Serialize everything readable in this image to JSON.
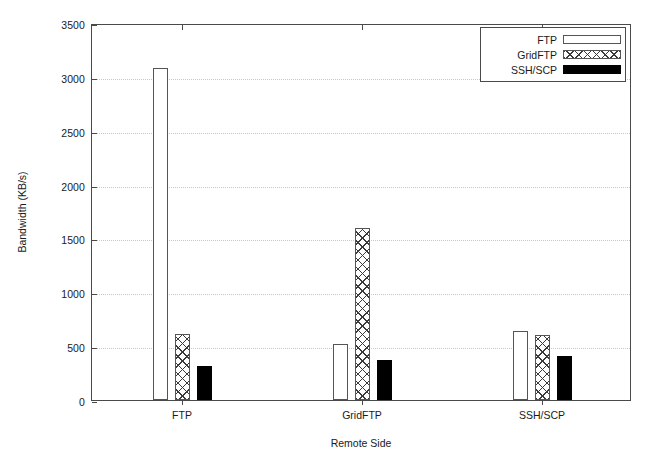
{
  "chart_data": {
    "type": "bar",
    "title": "",
    "subtitle": "",
    "xlabel": "Remote Side",
    "ylabel": "Bandwidth (KB/s)",
    "categories": [
      "FTP",
      "GridFTP",
      "SSH/SCP"
    ],
    "series": [
      {
        "name": "FTP",
        "fill": "open",
        "values": [
          3085,
          520,
          645
        ]
      },
      {
        "name": "GridFTP",
        "fill": "hatch",
        "values": [
          610,
          1595,
          605
        ]
      },
      {
        "name": "SSH/SCP",
        "fill": "solid",
        "values": [
          315,
          370,
          405
        ]
      }
    ],
    "ylim": [
      0,
      3500
    ],
    "ytick_step": 500,
    "yticks": [
      0,
      500,
      1000,
      1500,
      2000,
      2500,
      3000,
      3500
    ],
    "ytick_labels": [
      "0",
      "500",
      "1000",
      "1500",
      "2000",
      "2500",
      "3000",
      "3500"
    ],
    "grid": true,
    "grid_axis": "y",
    "grid_style": "dotted",
    "legend_position": "top-right",
    "legend_entries": [
      "FTP",
      "GridFTP",
      "SSH/SCP"
    ],
    "colors": {
      "axis": "#4a4a4a",
      "grid": "#c8c8c8",
      "bar_outline": "#555555",
      "bar_solid": "#000000",
      "background": "#ffffff",
      "text": "#1a1a1a"
    }
  }
}
